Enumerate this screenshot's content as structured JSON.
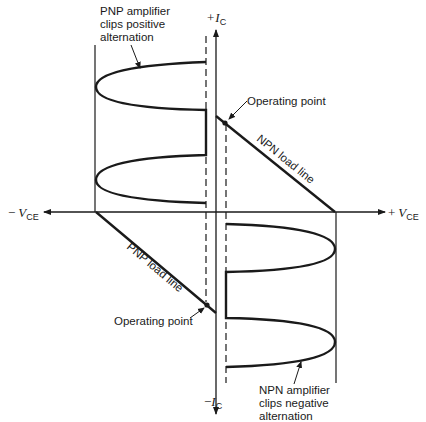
{
  "diagram": {
    "axes": {
      "vertical_positive": {
        "sign": "+",
        "symbol": "I",
        "subscript": "C"
      },
      "vertical_negative": {
        "sign": "−",
        "symbol": "I",
        "subscript": "C"
      },
      "horizontal_positive": {
        "sign": "+",
        "symbol": "V",
        "subscript": "CE"
      },
      "horizontal_negative": {
        "sign": "−",
        "symbol": "V",
        "subscript": "CE"
      }
    },
    "labels": {
      "pnp_clip": [
        "PNP amplifier",
        "clips positive",
        "alternation"
      ],
      "npn_clip": [
        "NPN amplifier",
        "clips negative",
        "alternation"
      ],
      "npn_operating_point": "Operating point",
      "pnp_operating_point": "Operating point",
      "npn_load_line": "NPN load line",
      "pnp_load_line": "PNP load line"
    },
    "colors": {
      "ink": "#1a1a1a",
      "background": "#ffffff"
    }
  }
}
